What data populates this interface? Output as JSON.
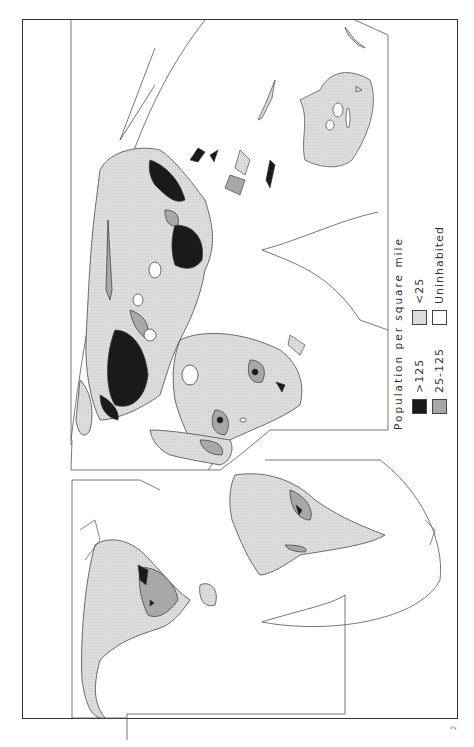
{
  "map": {
    "subject": "World population density",
    "orientation": "rotated 90 degrees counter-clockwise",
    "colors": {
      "over_125": "#1a1a1a",
      "between_25_125": "#a8a8a8",
      "under_25": "#dcdcdc",
      "uninhabited": "#ffffff",
      "outline": "#444444"
    }
  },
  "legend": {
    "title": "Population per square mile",
    "items": [
      {
        "label": ">125",
        "color": "#1a1a1a"
      },
      {
        "label": "25-125",
        "color": "#a8a8a8"
      },
      {
        "label": "<25",
        "color": "#dcdcdc"
      },
      {
        "label": "Uninhabited",
        "color": "#ffffff"
      }
    ]
  },
  "page_mark": "2"
}
